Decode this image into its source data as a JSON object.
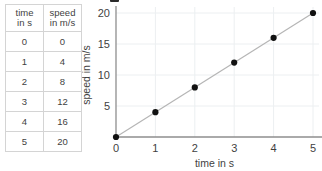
{
  "table": {
    "headers": [
      {
        "line1": "time",
        "line2": "in s"
      },
      {
        "line1": "speed",
        "line2": "in m/s"
      }
    ],
    "rows": [
      {
        "time": "0",
        "speed": "0"
      },
      {
        "time": "1",
        "speed": "4"
      },
      {
        "time": "2",
        "speed": "8"
      },
      {
        "time": "3",
        "speed": "12"
      },
      {
        "time": "4",
        "speed": "16"
      },
      {
        "time": "5",
        "speed": "20"
      }
    ]
  },
  "chart_data": {
    "type": "scatter",
    "title": "",
    "xlabel": "time in s",
    "ylabel": "speed in m/s",
    "x": [
      0,
      1,
      2,
      3,
      4,
      5
    ],
    "values": [
      0,
      4,
      8,
      12,
      16,
      20
    ],
    "series": [
      {
        "name": "speed",
        "values": [
          0,
          4,
          8,
          12,
          16,
          20
        ]
      }
    ],
    "xlim": [
      0,
      5
    ],
    "ylim": [
      0,
      20
    ],
    "xticks": [
      "0",
      "1",
      "2",
      "3",
      "4",
      "5"
    ],
    "yticks": [
      "5",
      "10",
      "15",
      "20"
    ],
    "ytick_values": [
      5,
      10,
      15,
      20
    ],
    "grid": true,
    "legend": "none",
    "trendline": true,
    "marker_color": "#111111",
    "line_color": "#b5b5b5",
    "grid_color": "#eceff1",
    "axis_color": "#8e8e8e"
  }
}
